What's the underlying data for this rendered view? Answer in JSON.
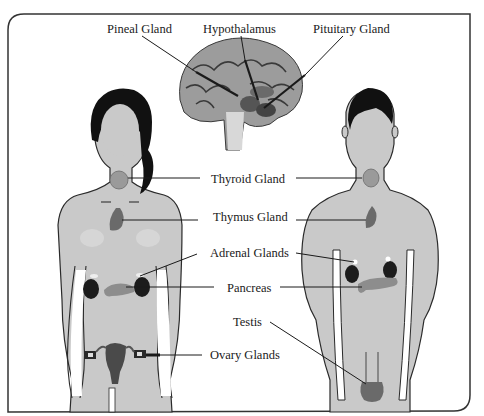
{
  "diagram": {
    "figures": [
      {
        "name": "female-body",
        "hair_color": "#111111"
      },
      {
        "name": "male-body",
        "hair_color": "#111111"
      },
      {
        "name": "brain-cross-section"
      }
    ],
    "colors": {
      "skin": "#c9c9c9",
      "outline": "#2a2a2a",
      "organ_dark": "#333333",
      "organ_mid": "#7a7a7a",
      "border": "#333333",
      "background": "#ffffff"
    },
    "labels": [
      {
        "id": "pineal",
        "text": "Pineal Gland",
        "x": 107,
        "y": 22
      },
      {
        "id": "hypothalamus",
        "text": "Hypothalamus",
        "x": 203,
        "y": 22
      },
      {
        "id": "pituitary",
        "text": "Pituitary Gland",
        "x": 313,
        "y": 22
      },
      {
        "id": "thyroid",
        "text": "Thyroid Gland",
        "x": 211,
        "y": 172
      },
      {
        "id": "thymus",
        "text": "Thymus Gland",
        "x": 213,
        "y": 210
      },
      {
        "id": "adrenal",
        "text": "Adrenal Glands",
        "x": 210,
        "y": 246
      },
      {
        "id": "pancreas",
        "text": "Pancreas",
        "x": 227,
        "y": 281
      },
      {
        "id": "testis",
        "text": "Testis",
        "x": 233,
        "y": 315
      },
      {
        "id": "ovary",
        "text": "Ovary Glands",
        "x": 210,
        "y": 348
      }
    ]
  }
}
